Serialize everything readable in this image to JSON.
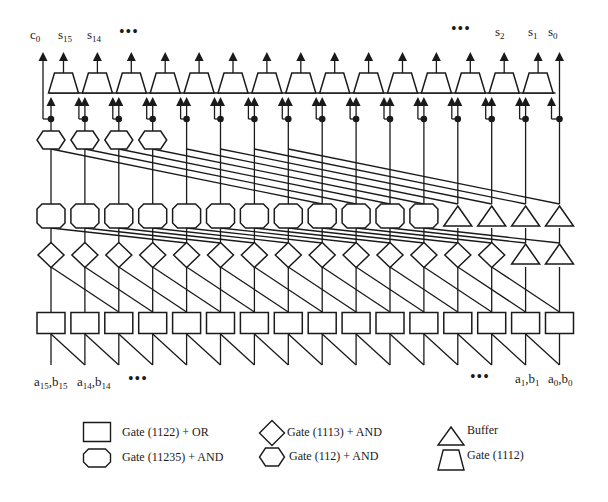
{
  "figure": {
    "columns": 16,
    "stroke_color": "#1a1a1a",
    "background": "#ffffff",
    "rows": {
      "trapezoid_row": {
        "gate": "Gate (1112)",
        "count": 15
      },
      "octagon_row_1": {
        "gate": "Gate (112) + AND",
        "shape": "hexagon",
        "count": 4
      },
      "octagon_row_2": {
        "gate": "Gate (11235) + AND",
        "shape": "octagon",
        "count": 12,
        "buffers": 4
      },
      "diamond_row": {
        "gate": "Gate (1113) + AND",
        "shape": "diamond",
        "count": 14,
        "buffers": 2
      },
      "square_row": {
        "gate": "Gate (1122) + OR",
        "shape": "square",
        "count": 16
      }
    },
    "wire_shifts": {
      "row1_to_row2": 8,
      "row2_to_diamond": 4,
      "diamond_to_square": 2,
      "input_to_square": 1
    }
  },
  "outputs": {
    "c0": {
      "base": "c",
      "sub": "0"
    },
    "s15": {
      "base": "s",
      "sub": "15"
    },
    "s14": {
      "base": "s",
      "sub": "14"
    },
    "ellipsis_left": "•••",
    "ellipsis_right": "•••",
    "s2": {
      "base": "s",
      "sub": "2"
    },
    "s1": {
      "base": "s",
      "sub": "1"
    },
    "s0": {
      "base": "s",
      "sub": "0"
    }
  },
  "inputs": {
    "a15b15": {
      "a": "a",
      "asub": "15",
      "b": "b",
      "bsub": "15"
    },
    "a14b14": {
      "a": "a",
      "asub": "14",
      "b": "b",
      "bsub": "14"
    },
    "ellipsis_left": "•••",
    "ellipsis_right": "•••",
    "a1b1": {
      "a": "a",
      "asub": "1",
      "b": "b",
      "bsub": "1"
    },
    "a0b0": {
      "a": "a",
      "asub": "0",
      "b": "b",
      "bsub": "0"
    }
  },
  "legend": {
    "items": [
      {
        "shape": "square",
        "label": "Gate (1122) + OR"
      },
      {
        "shape": "diamond",
        "label": "Gate (1113) + AND"
      },
      {
        "shape": "triangle",
        "label": "Buffer"
      },
      {
        "shape": "octagon",
        "label": "Gate (11235) + AND"
      },
      {
        "shape": "hexagon",
        "label": "Gate (112) + AND"
      },
      {
        "shape": "trapezoid",
        "label": "Gate (1112)"
      }
    ]
  }
}
